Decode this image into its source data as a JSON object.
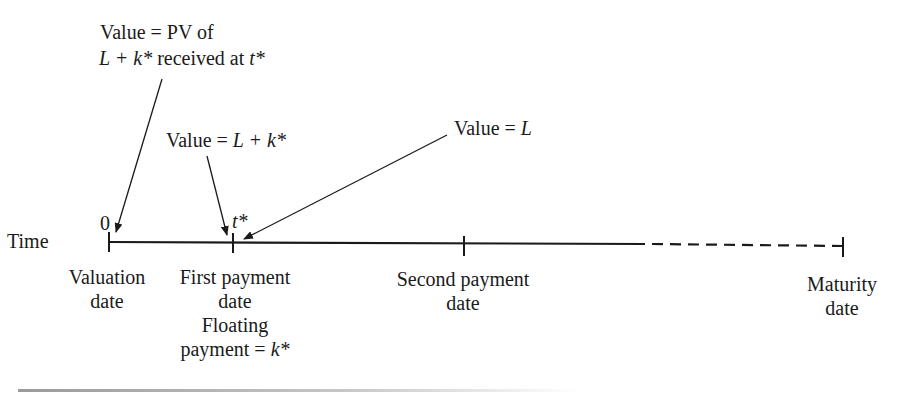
{
  "diagram": {
    "axis_label": "Time",
    "tick_labels": {
      "origin": "0",
      "first_payment": "t*"
    },
    "annotations": {
      "pv_value_line1": "Value = PV of",
      "pv_value_line2_prefix": "L + k*",
      "pv_value_line2_mid": " received at ",
      "pv_value_line2_suffix": "t*",
      "value_before_payment_prefix": "Value = ",
      "value_before_payment_math": "L + k*",
      "value_after_payment_prefix": "Value = ",
      "value_after_payment_math": "L"
    },
    "points": [
      {
        "name": "valuation",
        "line1": "Valuation",
        "line2": "date"
      },
      {
        "name": "first-payment",
        "line1": "First payment",
        "line2": "date",
        "line3": "Floating",
        "line4_prefix": "payment = ",
        "line4_math": "k*"
      },
      {
        "name": "second-payment",
        "line1": "Second payment",
        "line2": "date"
      },
      {
        "name": "maturity",
        "line1": "Maturity",
        "line2": "date"
      }
    ],
    "colors": {
      "line": "#1a1a1a",
      "rule": "#9a9a9a"
    }
  }
}
